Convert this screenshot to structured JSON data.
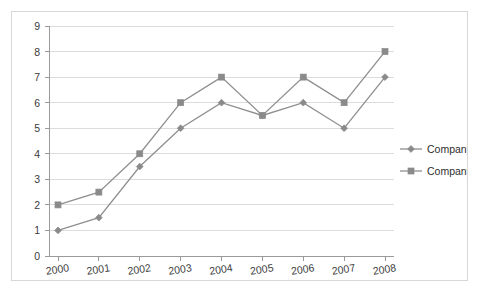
{
  "chart_data": {
    "type": "line",
    "title": "",
    "xlabel": "",
    "ylabel": "",
    "categories": [
      "2000",
      "2001",
      "2002",
      "2003",
      "2004",
      "2005",
      "2006",
      "2007",
      "2008"
    ],
    "series": [
      {
        "name": "Company A",
        "marker": "diamond",
        "color": "#8a8a8a",
        "values": [
          1,
          1.5,
          3.5,
          5,
          6,
          5.5,
          6,
          5,
          7
        ]
      },
      {
        "name": "Company B",
        "marker": "square",
        "color": "#8a8a8a",
        "values": [
          2,
          2.5,
          4,
          6,
          7,
          5.5,
          7,
          6,
          8
        ]
      }
    ],
    "ylim": [
      0,
      9
    ],
    "y_ticks": [
      "0",
      "1",
      "2",
      "3",
      "4",
      "5",
      "6",
      "7",
      "8",
      "9"
    ],
    "grid": true,
    "legend_position": "right"
  },
  "legend": {
    "entries": [
      {
        "label": "Company A",
        "marker": "diamond-marker-icon"
      },
      {
        "label": "Company B",
        "marker": "square-marker-icon"
      }
    ]
  },
  "colors": {
    "frame_border": "#d7d7d7",
    "axis": "#9a9a9a",
    "gridline": "#dcdcdc",
    "series": "#8a8a8a",
    "text": "#3b3b3b",
    "background": "#ffffff"
  }
}
